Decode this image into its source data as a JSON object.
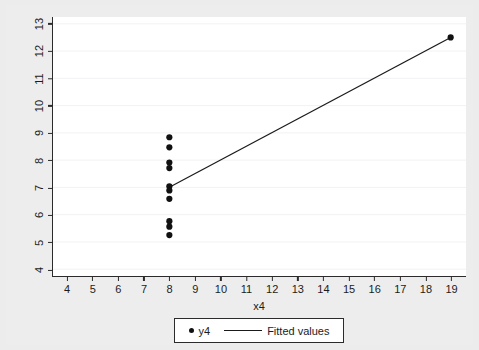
{
  "chart_data": {
    "type": "scatter",
    "title": "",
    "subtitle": "",
    "xlabel": "x4",
    "ylabel": "",
    "xlim": [
      3.45,
      19.6
    ],
    "ylim": [
      3.75,
      13.25
    ],
    "xticks": [
      4,
      5,
      6,
      7,
      8,
      9,
      10,
      11,
      12,
      13,
      14,
      15,
      16,
      17,
      18,
      19
    ],
    "yticks": [
      4,
      5,
      6,
      7,
      8,
      9,
      10,
      11,
      12,
      13
    ],
    "grid": "horizontal-faint",
    "legend_position": "below-axis-center",
    "series": [
      {
        "name": "y4",
        "type": "scatter",
        "marker": "circle",
        "color": "#111111",
        "points": [
          {
            "x": 8,
            "y": 6.58
          },
          {
            "x": 8,
            "y": 5.76
          },
          {
            "x": 8,
            "y": 7.71
          },
          {
            "x": 8,
            "y": 8.84
          },
          {
            "x": 8,
            "y": 8.47
          },
          {
            "x": 8,
            "y": 7.04
          },
          {
            "x": 8,
            "y": 5.25
          },
          {
            "x": 19,
            "y": 12.5
          },
          {
            "x": 8,
            "y": 5.56
          },
          {
            "x": 8,
            "y": 7.91
          },
          {
            "x": 8,
            "y": 6.89
          }
        ]
      },
      {
        "name": "Fitted values",
        "type": "line",
        "color": "#1a1a1a",
        "points": [
          {
            "x": 8,
            "y": 7.005
          },
          {
            "x": 19,
            "y": 12.5
          }
        ]
      }
    ]
  },
  "legend": {
    "items": [
      {
        "label": "y4",
        "glyph": "scatter-dot"
      },
      {
        "label": "Fitted values",
        "glyph": "line-segment"
      }
    ]
  },
  "axis": {
    "x_title": "x4",
    "y_title": ""
  }
}
